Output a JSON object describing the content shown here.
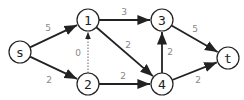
{
  "nodes": [
    {
      "id": "s",
      "label": "s",
      "x": 20,
      "y": 52
    },
    {
      "id": "1",
      "label": "1",
      "x": 88,
      "y": 20
    },
    {
      "id": "2",
      "label": "2",
      "x": 88,
      "y": 84
    },
    {
      "id": "3",
      "label": "3",
      "x": 162,
      "y": 20
    },
    {
      "id": "4",
      "label": "4",
      "x": 162,
      "y": 84
    },
    {
      "id": "t",
      "label": "t",
      "x": 228,
      "y": 58
    }
  ],
  "edges": [
    {
      "from": "s",
      "to": "1",
      "label": "5",
      "style": "solid",
      "lx": 48,
      "ly": 31
    },
    {
      "from": "s",
      "to": "2",
      "label": "2",
      "style": "solid",
      "lx": 49,
      "ly": 83
    },
    {
      "from": "2",
      "to": "1",
      "label": "0",
      "style": "dotted",
      "lx": 78,
      "ly": 56
    },
    {
      "from": "1",
      "to": "3",
      "label": "3",
      "style": "solid",
      "lx": 124,
      "ly": 15
    },
    {
      "from": "1",
      "to": "4",
      "label": "2",
      "style": "solid",
      "lx": 128,
      "ly": 48
    },
    {
      "from": "2",
      "to": "4",
      "label": "2",
      "style": "solid",
      "lx": 123,
      "ly": 79
    },
    {
      "from": "4",
      "to": "3",
      "label": "2",
      "style": "solid",
      "lx": 170,
      "ly": 55
    },
    {
      "from": "3",
      "to": "t",
      "label": "5",
      "style": "solid",
      "lx": 195,
      "ly": 32
    },
    {
      "from": "4",
      "to": "t",
      "label": "2",
      "style": "solid",
      "lx": 198,
      "ly": 83
    }
  ]
}
